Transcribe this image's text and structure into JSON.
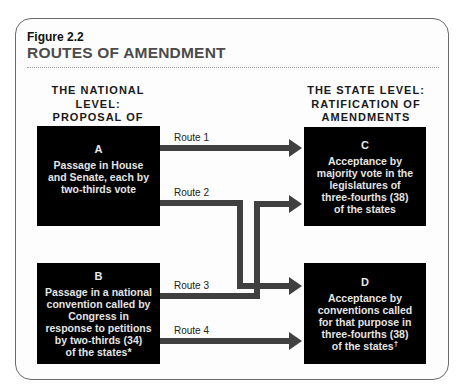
{
  "figure": {
    "label": "Figure 2.2",
    "title": "ROUTES OF AMENDMENT"
  },
  "columns": {
    "national": {
      "lines": [
        "THE NATIONAL LEVEL:",
        "PROPOSAL OF",
        "AMENDMENTS"
      ]
    },
    "state": {
      "lines": [
        "THE STATE LEVEL:",
        "RATIFICATION OF",
        "AMENDMENTS"
      ]
    }
  },
  "boxes": {
    "A": {
      "letter": "A",
      "lines": [
        "Passage in House",
        "and Senate, each by",
        "two-thirds vote"
      ]
    },
    "B": {
      "letter": "B",
      "lines": [
        "Passage in a national",
        "convention called by",
        "Congress in",
        "response to petitions",
        "by two-thirds (34)",
        "of the states*"
      ]
    },
    "C": {
      "letter": "C",
      "lines": [
        "Acceptance by",
        "majority vote in the",
        "legislatures of",
        "three-fourths (38)",
        "of the states"
      ]
    },
    "D": {
      "letter": "D",
      "lines": [
        "Acceptance by",
        "conventions called",
        "for that purpose in",
        "three-fourths (38)",
        "of the states"
      ],
      "footnote_mark": "†"
    }
  },
  "routes": [
    {
      "label": "Route 1",
      "from": "A",
      "to": "C"
    },
    {
      "label": "Route 2",
      "from": "A",
      "to": "D"
    },
    {
      "label": "Route 3",
      "from": "B",
      "to": "C"
    },
    {
      "label": "Route 4",
      "from": "B",
      "to": "D"
    }
  ],
  "colors": {
    "box_fill": "#000000",
    "box_text": "#e4e4e4",
    "arrow": "#404040",
    "title": "#4b4b4b",
    "frame": "#6a6a6a"
  }
}
